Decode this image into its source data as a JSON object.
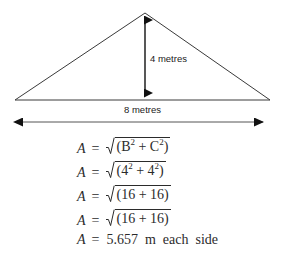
{
  "figure": {
    "shape": "isosceles-triangle",
    "height_label": "4 metres",
    "base_label": "8 metres",
    "height_value": 4,
    "base_value": 8,
    "units": "metres",
    "stroke_color": "#3a3a3a"
  },
  "equations": [
    {
      "var": "A",
      "eq": "=",
      "kind": "radical",
      "radicand": "(B² + C²)",
      "radicand_html": "(B<sup>2</sup> + C<sup>2</sup>)",
      "plain": "A = √(B² + C²)"
    },
    {
      "var": "A",
      "eq": "=",
      "kind": "radical",
      "radicand": "(4² + 4²)",
      "radicand_html": "(4<sup>2</sup> + 4<sup>2</sup>)",
      "plain": "A = √(4² + 4²)"
    },
    {
      "var": "A",
      "eq": "=",
      "kind": "radical",
      "radicand": "(16 + 16)",
      "radicand_html": "(16 + 16)",
      "plain": "A = √(16 + 16)"
    },
    {
      "var": "A",
      "eq": "=",
      "kind": "radical",
      "radicand": "(16 + 16)",
      "radicand_html": "(16 + 16)",
      "plain": "A = √(16 + 16)"
    },
    {
      "var": "A",
      "eq": "=",
      "kind": "plain",
      "result": "5.657  m  each  side",
      "plain": "A = 5.657 m each side"
    }
  ]
}
